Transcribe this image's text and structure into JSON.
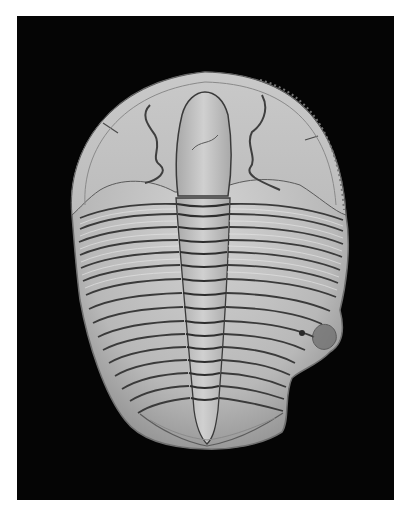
{
  "image": {
    "subject": "Trilobite fossil",
    "background_color": "#050505",
    "fossil_color": "#bdbdbd",
    "groove_color": "#3a3a3a",
    "page_background": "#ffffff"
  },
  "fossil": {
    "parts": [
      "cephalon",
      "glabella",
      "thorax",
      "axis",
      "pleurae",
      "pygidium"
    ],
    "thoracic_segment_count": 16
  }
}
